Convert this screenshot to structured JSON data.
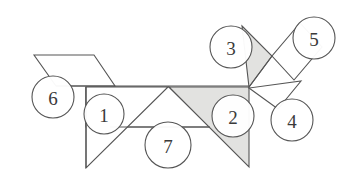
{
  "figure": {
    "type": "tangram-dissection-diagram",
    "title": "",
    "background_color": "#ffffff",
    "stroke_color": "#555555",
    "shaded_fill": "#e2e2e0",
    "plain_fill": "#ffffff",
    "label_text_color": "#3a3a3a",
    "label_count": 7,
    "pieces": [
      {
        "id": "piece-1",
        "label": "1",
        "shape": "right-triangle",
        "shaded": false,
        "points": "86,87 86,168 168,87",
        "label_x": 104,
        "label_y": 114,
        "label_r": 20
      },
      {
        "id": "piece-2",
        "label": "2",
        "shape": "right-triangle",
        "shaded": true,
        "points": "169,87 249,87 249,167",
        "label_x": 233,
        "label_y": 116,
        "label_r": 21
      },
      {
        "id": "piece-3",
        "label": "3",
        "shape": "right-triangle",
        "shaded": true,
        "points": "242,26 272,56 249,87",
        "label_x": 231,
        "label_y": 47,
        "label_r": 21
      },
      {
        "id": "piece-4",
        "label": "4",
        "shape": "triangle",
        "shaded": false,
        "points": "249,88 278,109 301,81",
        "label_x": 292,
        "label_y": 120,
        "label_r": 21
      },
      {
        "id": "piece-5",
        "label": "5",
        "shape": "square",
        "shaded": false,
        "points": "300,23 272,56 294,80 322,47",
        "label_x": 314,
        "label_y": 38,
        "label_r": 21
      },
      {
        "id": "piece-6",
        "label": "6",
        "shape": "parallelogram",
        "shaded": false,
        "points": "34,55 94,55 115,86 56,86",
        "label_x": 53,
        "label_y": 97,
        "label_r": 21
      },
      {
        "id": "piece-7",
        "label": "7",
        "shape": "trapezoid",
        "shaded": false,
        "points": "110,127 210,127 169,87 86,87 86,127",
        "label_x": 168,
        "label_y": 145,
        "label_r": 23
      }
    ],
    "extra_edges": [
      {
        "id": "edge-spine",
        "from_x": 56,
        "from_y": 86,
        "to_x": 249,
        "to_y": 86
      },
      {
        "id": "edge-belly",
        "from_x": 110,
        "from_y": 127,
        "to_x": 210,
        "to_y": 127
      },
      {
        "id": "edge-leg-front",
        "from_x": 86,
        "from_y": 87,
        "to_x": 86,
        "to_y": 168
      },
      {
        "id": "edge-tail-link",
        "from_x": 249,
        "from_y": 87,
        "to_x": 272,
        "to_y": 56
      }
    ]
  }
}
